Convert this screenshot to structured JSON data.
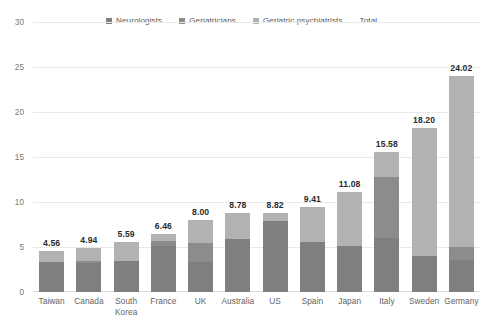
{
  "chart_data": {
    "type": "bar",
    "subtype": "stacked-bar",
    "title": "",
    "subtitle": "",
    "xlabel": "",
    "ylabel": "",
    "ylim": [
      0,
      30
    ],
    "yticks": [
      "0",
      "5",
      "10",
      "15",
      "20",
      "25",
      "30"
    ],
    "ytick_values": [
      0,
      5,
      10,
      15,
      20,
      25,
      30
    ],
    "grid": true,
    "legend_position": "top",
    "categories": [
      "Taiwan",
      "Canada",
      "South\nKorea",
      "France",
      "UK",
      "Australia",
      "US",
      "Spain",
      "Japan",
      "Italy",
      "Sweden",
      "Germany"
    ],
    "series": [
      {
        "name": "Neurologists",
        "color": "#7f7f7f",
        "values": [
          3.3,
          3.2,
          3.4,
          5.15,
          3.35,
          5.9,
          7.9,
          5.55,
          5.15,
          6.0,
          4.05,
          3.55
        ]
      },
      {
        "name": "Geriatricians",
        "color": "#8c8c8c",
        "values": [
          0.0,
          0.3,
          0.0,
          0.55,
          2.05,
          0.0,
          0.0,
          0.0,
          0.0,
          6.8,
          0.0,
          1.5
        ]
      },
      {
        "name": "Geriatric psychiatrists",
        "color": "#b2b2b2",
        "values": [
          1.26,
          1.44,
          2.19,
          0.76,
          2.6,
          2.88,
          0.92,
          3.86,
          5.93,
          2.78,
          14.15,
          18.97
        ]
      }
    ],
    "totals": [
      "4.56",
      "4.94",
      "5.59",
      "6.46",
      "8.00",
      "8.78",
      "8.82",
      "9.41",
      "11.08",
      "15.58",
      "18.20",
      "24.02"
    ],
    "total_values": [
      4.56,
      4.94,
      5.59,
      6.46,
      8.0,
      8.78,
      8.82,
      9.41,
      11.08,
      15.58,
      18.2,
      24.02
    ]
  },
  "legend": {
    "items": [
      {
        "label": "Neurologists",
        "color": "#7f7f7f",
        "swatch": true
      },
      {
        "label": "Geriatricians",
        "color": "#8c8c8c",
        "swatch": true
      },
      {
        "label": "Geriatric psychiatrists",
        "color": "#b2b2b2",
        "swatch": true
      },
      {
        "label": "Total",
        "color": "transparent",
        "swatch": false
      }
    ]
  },
  "colors": {
    "neurologists": "#7f7f7f",
    "geriatricians": "#8c8c8c",
    "geriatric_psychiatrists": "#b2b2b2",
    "gridline": "#e9e9e9",
    "axis_text": "#7a7a7a",
    "label_text": "#636363",
    "total_text": "#2b2b2b",
    "background": "#ffffff"
  }
}
